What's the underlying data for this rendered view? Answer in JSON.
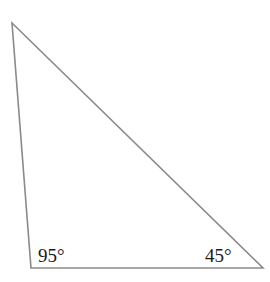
{
  "diagram": {
    "type": "triangle",
    "vertices": {
      "top": [
        12,
        23
      ],
      "bottom_left": [
        31,
        268
      ],
      "bottom_right": [
        263,
        268
      ]
    },
    "stroke_color": "#8a8a8a",
    "angles": [
      {
        "vertex": "bottom_left",
        "label": "95°"
      },
      {
        "vertex": "bottom_right",
        "label": "45°"
      }
    ]
  }
}
